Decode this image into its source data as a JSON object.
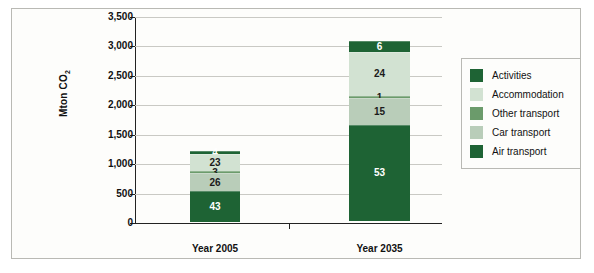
{
  "chart_data": {
    "type": "bar",
    "stacked": true,
    "title": "",
    "xlabel": "",
    "ylabel": "Mton CO2",
    "ylabel_text": "Mton CO",
    "ylabel_sub": "2",
    "categories": [
      "Year 2005",
      "Year 2035"
    ],
    "ylim": [
      0,
      3500
    ],
    "yticks": [
      0,
      500,
      1000,
      1500,
      2000,
      2500,
      3000,
      3500
    ],
    "ytick_labels": [
      "0",
      "500",
      "1,000",
      "1,500",
      "2,000",
      "2,500",
      "3,000",
      "3,500"
    ],
    "grid": true,
    "legend_position": "right",
    "totals": [
      1220,
      3090
    ],
    "value_unit": "percent",
    "series": [
      {
        "name": "Activities",
        "color": "#1e6334",
        "label_color": "#ffffff",
        "values": [
          4,
          6
        ]
      },
      {
        "name": "Accommodation",
        "color": "#d2e2d2",
        "label_color": "#1b1b1b",
        "values": [
          23,
          24
        ]
      },
      {
        "name": "Other transport",
        "color": "#6b9b6b",
        "label_color": "#1b1b1b",
        "values": [
          3,
          1
        ]
      },
      {
        "name": "Car transport",
        "color": "#b9cdb9",
        "label_color": "#1b1b1b",
        "values": [
          26,
          15
        ]
      },
      {
        "name": "Air transport",
        "color": "#1e6334",
        "label_color": "#ffffff",
        "values": [
          43,
          53
        ]
      }
    ],
    "stack_order_top_to_bottom": [
      "Activities",
      "Accommodation",
      "Other transport",
      "Car transport",
      "Air transport"
    ]
  },
  "legend": {
    "items": [
      {
        "label": "Activities",
        "color": "#1e6334"
      },
      {
        "label": "Accommodation",
        "color": "#d2e2d2"
      },
      {
        "label": "Other transport",
        "color": "#6b9b6b"
      },
      {
        "label": "Car transport",
        "color": "#b9cdb9"
      },
      {
        "label": "Air transport",
        "color": "#1e6334"
      }
    ]
  },
  "axis": {
    "tick_labels": [
      "3,500",
      "3,000",
      "2,500",
      "2,000",
      "1,500",
      "1,000",
      "500",
      "0"
    ]
  },
  "bar_labels": {
    "year2005": [
      "4",
      "23",
      "3",
      "26",
      "43"
    ],
    "year2035": [
      "6",
      "24",
      "1",
      "15",
      "53"
    ]
  },
  "category_labels": [
    "Year 2005",
    "Year 2035"
  ]
}
